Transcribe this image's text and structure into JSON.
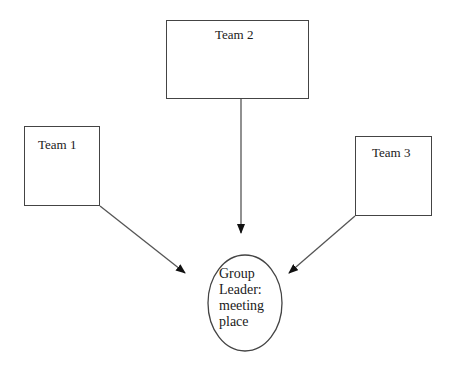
{
  "diagram": {
    "type": "flow",
    "nodes": [
      {
        "id": "team1",
        "label": "Team 1",
        "shape": "rectangle"
      },
      {
        "id": "team2",
        "label": "Team 2",
        "shape": "rectangle"
      },
      {
        "id": "team3",
        "label": "Team 3",
        "shape": "rectangle"
      },
      {
        "id": "leader",
        "label_lines": [
          "Group",
          "Leader:",
          "meeting",
          "place"
        ],
        "shape": "ellipse"
      }
    ],
    "edges": [
      {
        "from": "team1",
        "to": "leader",
        "style": "arrow"
      },
      {
        "from": "team2",
        "to": "leader",
        "style": "arrow"
      },
      {
        "from": "team3",
        "to": "leader",
        "style": "arrow"
      }
    ],
    "colors": {
      "stroke": "#444444",
      "text": "#1a1a1a",
      "background": "#ffffff"
    }
  }
}
